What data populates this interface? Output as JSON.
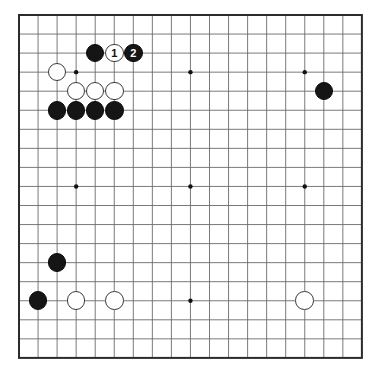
{
  "diagram": {
    "type": "go-board-diagram",
    "board_size": 19,
    "colors": {
      "board_background": "#ffffff",
      "grid_line": "#6b6b6b",
      "border_line": "#2b2b2b",
      "black_stone": "#151515",
      "white_stone": "#ffffff",
      "white_stone_border": "#3a3a3a",
      "star_point": "#111111"
    },
    "geometry": {
      "origin_x": 19,
      "origin_y": 15,
      "cell": 19.05,
      "stone_radius": 9.3,
      "star_radius": 2.2,
      "border_width": 2
    },
    "star_points": [
      {
        "col": 4,
        "row": 4
      },
      {
        "col": 10,
        "row": 4
      },
      {
        "col": 16,
        "row": 4
      },
      {
        "col": 4,
        "row": 10
      },
      {
        "col": 10,
        "row": 10
      },
      {
        "col": 16,
        "row": 10
      },
      {
        "col": 4,
        "row": 16
      },
      {
        "col": 10,
        "row": 16
      },
      {
        "col": 16,
        "row": 16
      }
    ],
    "stones": [
      {
        "id": "b-top-1",
        "color": "black",
        "col": 5,
        "row": 3,
        "label": ""
      },
      {
        "id": "w-move-1",
        "color": "white",
        "col": 6,
        "row": 3,
        "label": "1"
      },
      {
        "id": "b-move-2",
        "color": "black",
        "col": 7,
        "row": 3,
        "label": "2"
      },
      {
        "id": "w-left-4-4",
        "color": "white",
        "col": 3,
        "row": 4,
        "label": ""
      },
      {
        "id": "w-row5-a",
        "color": "white",
        "col": 4,
        "row": 5,
        "label": ""
      },
      {
        "id": "w-row5-b",
        "color": "white",
        "col": 5,
        "row": 5,
        "label": ""
      },
      {
        "id": "w-row5-c",
        "color": "white",
        "col": 6,
        "row": 5,
        "label": ""
      },
      {
        "id": "b-row6-a",
        "color": "black",
        "col": 3,
        "row": 6,
        "label": ""
      },
      {
        "id": "b-row6-b",
        "color": "black",
        "col": 4,
        "row": 6,
        "label": ""
      },
      {
        "id": "b-row6-c",
        "color": "black",
        "col": 5,
        "row": 6,
        "label": ""
      },
      {
        "id": "b-row6-d",
        "color": "black",
        "col": 6,
        "row": 6,
        "label": ""
      },
      {
        "id": "b-right-upper",
        "color": "black",
        "col": 17,
        "row": 5,
        "label": ""
      },
      {
        "id": "b-lower-left-high",
        "color": "black",
        "col": 3,
        "row": 14,
        "label": ""
      },
      {
        "id": "b-lower-left-edge",
        "color": "black",
        "col": 2,
        "row": 16,
        "label": ""
      },
      {
        "id": "w-bottom-a",
        "color": "white",
        "col": 4,
        "row": 16,
        "label": ""
      },
      {
        "id": "w-bottom-b",
        "color": "white",
        "col": 6,
        "row": 16,
        "label": ""
      },
      {
        "id": "w-bottom-right",
        "color": "white",
        "col": 16,
        "row": 16,
        "label": ""
      }
    ],
    "move_markers": [
      {
        "number": "1",
        "color": "white",
        "col": 6,
        "row": 3
      },
      {
        "number": "2",
        "color": "black",
        "col": 7,
        "row": 3
      }
    ]
  }
}
